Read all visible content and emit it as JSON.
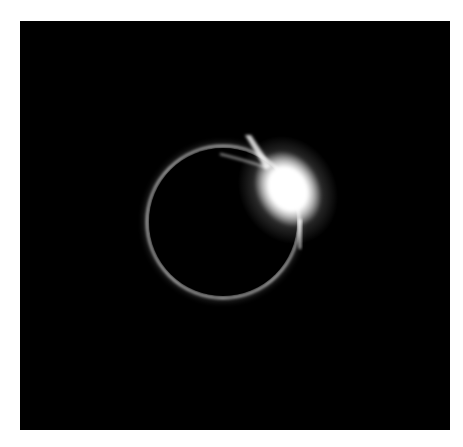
{
  "image": {
    "description": "Total solar eclipse diamond ring effect",
    "subject": "eclipse",
    "colors": {
      "background": "#000000",
      "border": "#ffffff",
      "corona": "#d8d8d8",
      "flare": "#ffffff"
    }
  }
}
